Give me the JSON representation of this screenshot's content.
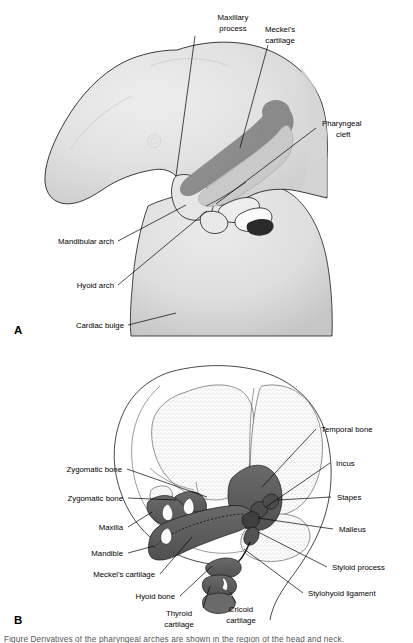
{
  "figure": {
    "domain": "anatomy-illustration",
    "panels": [
      {
        "letter": "A",
        "name": "embryo-pharyngeal-arches",
        "labels": [
          "Maxillary process",
          "Meckel's cartilage",
          "Pharyngeal cleft",
          "Mandibular arch",
          "Hyoid arch",
          "Cardiac bulge"
        ]
      },
      {
        "letter": "B",
        "name": "fetal-skull-derivatives",
        "labels": [
          "Temporal bone",
          "Incus",
          "Stapes",
          "Malleus",
          "Styloid process",
          "Stylohyoid ligament",
          "Zygomatic bone",
          "Zygomatic bone",
          "Maxilla",
          "Mandible",
          "Meckel's cartilage",
          "Hyoid bone",
          "Thyroid cartilage",
          "Cricoid cartilage"
        ]
      }
    ]
  },
  "panelA": {
    "letter": "A",
    "labels": {
      "maxillary_process_l1": "Maxillary",
      "maxillary_process_l2": "process",
      "meckels_cartilage_l1": "Meckel's",
      "meckels_cartilage_l2": "cartilage",
      "pharyngeal_cleft_l1": "Pharyngeal",
      "pharyngeal_cleft_l2": "cleft",
      "mandibular_arch": "Mandibular arch",
      "hyoid_arch": "Hyoid arch",
      "cardiac_bulge": "Cardiac bulge"
    }
  },
  "panelB": {
    "letter": "B",
    "labels": {
      "temporal_bone": "Temporal bone",
      "incus": "Incus",
      "stapes": "Stapes",
      "malleus": "Malleus",
      "styloid_process": "Styloid process",
      "stylohyoid_ligament": "Stylohyoid ligament",
      "zygomatic_bone_upper": "Zygomatic bone",
      "zygomatic_bone_lower": "Zygomatic bone",
      "maxilla": "Maxilla",
      "mandible": "Mandible",
      "meckels_cartilage": "Meckel's cartilage",
      "hyoid_bone": "Hyoid bone",
      "thyroid_cartilage_l1": "Thyroid",
      "thyroid_cartilage_l2": "cartilage",
      "cricoid_cartilage_l1": "Cricoid",
      "cricoid_cartilage_l2": "cartilage"
    }
  },
  "caption": {
    "truncated_line": "Figure  Derivatives of the pharyngeal arches are shown in the region of the head and neck."
  },
  "colors": {
    "background": "#ffffff",
    "body_light_gray": "#e3e3e3",
    "body_mid_gray": "#d4d4d4",
    "body_shadow_gray": "#c2c2c2",
    "arch_dark_gray": "#8d8d8d",
    "arch_mid_gray": "#a8a8a8",
    "arch_light_gray": "#d0d0d0",
    "bone_dark": "#5e5e5e",
    "bone_outline": "#1a1a1a",
    "stipple_gray": "#9a9a9a",
    "text_black": "#000000",
    "leader_line": "#000000"
  }
}
